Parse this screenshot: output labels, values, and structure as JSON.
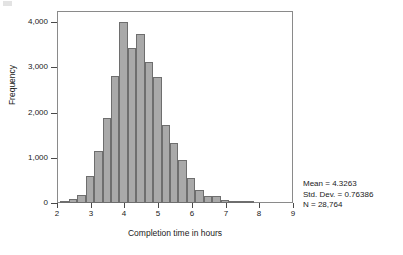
{
  "figure": {
    "name": "completion-time-histogram"
  },
  "chart_data": {
    "type": "bar",
    "title": "",
    "xlabel": "Completion time in hours",
    "ylabel": "Frequency",
    "xlim": [
      2,
      9
    ],
    "ylim": [
      0,
      4250
    ],
    "grid": false,
    "legend": null,
    "bin_width": 0.25,
    "x_ticks": [
      "2",
      "3",
      "4",
      "5",
      "6",
      "7",
      "8",
      "9"
    ],
    "x_tick_values": [
      2,
      3,
      4,
      5,
      6,
      7,
      8,
      9
    ],
    "y_ticks": [
      "0",
      "1,000",
      "2,000",
      "3,000",
      "4,000"
    ],
    "y_tick_values": [
      0,
      1000,
      2000,
      3000,
      4000
    ],
    "bin_starts": [
      2.1,
      2.35,
      2.6,
      2.85,
      3.1,
      3.35,
      3.6,
      3.85,
      4.1,
      4.35,
      4.6,
      4.85,
      5.1,
      5.35,
      5.6,
      5.85,
      6.1,
      6.35,
      6.6,
      6.85,
      7.1,
      7.35,
      7.6
    ],
    "values": [
      30,
      90,
      180,
      600,
      1150,
      1880,
      2820,
      4000,
      3440,
      3750,
      3130,
      2780,
      1720,
      1320,
      960,
      560,
      280,
      150,
      150,
      70,
      30,
      20,
      10
    ],
    "annotations": [
      "Mean = 4.3263",
      "Std. Dev. = 0.76386",
      "N = 28,764"
    ],
    "colors": {
      "bar_fill": "#a9a9a9",
      "bar_edge": "#6e6e6e",
      "frame": "#8a8a8a",
      "text": "#1a1a1a"
    }
  },
  "stats": {
    "mean_label": "Mean = 4.3263",
    "stddev_label": "Std. Dev. = 0.76386",
    "n_label": "N = 28,764"
  }
}
